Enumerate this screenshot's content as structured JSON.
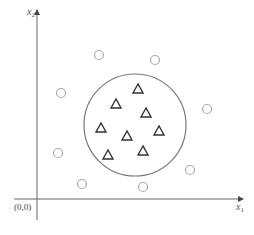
{
  "diagram": {
    "title": "",
    "x_axis_label": "x",
    "x_axis_subscript": "1",
    "y_axis_label": "x",
    "y_axis_subscript": "2",
    "origin_label": "(0,0)",
    "decision_boundary": {
      "shape": "circle",
      "cx": 135,
      "cy": 125,
      "r": 51,
      "color": "#777777"
    },
    "class_triangle": {
      "marker": "triangle",
      "color": "#333333",
      "points": [
        [
          138,
          89
        ],
        [
          116,
          104
        ],
        [
          146,
          113
        ],
        [
          101,
          128
        ],
        [
          127,
          136
        ],
        [
          159,
          131
        ],
        [
          108,
          155
        ],
        [
          143,
          151
        ]
      ]
    },
    "class_circle": {
      "marker": "circle",
      "color": "#aaaaaa",
      "points": [
        [
          99,
          55
        ],
        [
          155,
          60
        ],
        [
          61,
          93
        ],
        [
          207,
          109
        ],
        [
          58,
          153
        ],
        [
          190,
          170
        ],
        [
          82,
          184
        ],
        [
          143,
          187
        ]
      ]
    }
  }
}
